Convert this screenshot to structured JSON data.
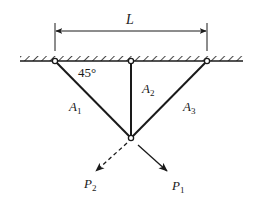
{
  "diagram": {
    "type": "truss-three-bar",
    "dimension": {
      "label": "L",
      "from_pin": "left",
      "to_pin": "right"
    },
    "angle_label": "45°",
    "members": [
      {
        "id": "A1",
        "label_main": "A",
        "label_sub": "1"
      },
      {
        "id": "A2",
        "label_main": "A",
        "label_sub": "2"
      },
      {
        "id": "A3",
        "label_main": "A",
        "label_sub": "3"
      }
    ],
    "loads": [
      {
        "id": "P1",
        "label_main": "P",
        "label_sub": "1",
        "style": "solid"
      },
      {
        "id": "P2",
        "label_main": "P",
        "label_sub": "2",
        "style": "dashed"
      }
    ],
    "colors": {
      "ink": "#1a1a1a",
      "background": "#ffffff"
    }
  }
}
